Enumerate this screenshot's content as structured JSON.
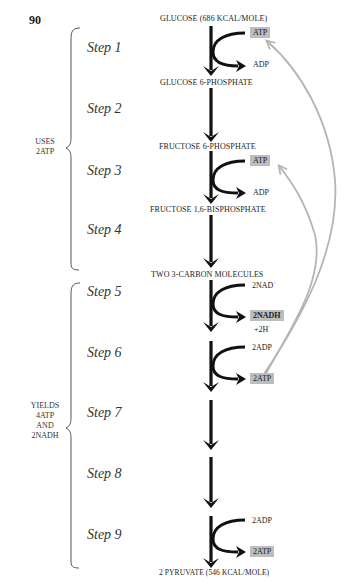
{
  "page_number": "90",
  "molecules": {
    "m0": "GLUCOSE (686 kcal/mole)",
    "m1": "GLUCOSE 6-PHOSPHATE",
    "m2": "FRUCTOSE 6-PHOSPHATE",
    "m3": "FRUCTOSE 1,6-BISPHOSPHATE",
    "m4": "TWO 3-CARBON MOLECULES",
    "m5": "2 PYRUVATE (546 kcal/mole)"
  },
  "steps": [
    "Step 1",
    "Step 2",
    "Step 3",
    "Step 4",
    "Step 5",
    "Step 6",
    "Step 7",
    "Step 8",
    "Step 9"
  ],
  "phases": {
    "uses": {
      "line1": "USES",
      "line2": "2ATP"
    },
    "yields": {
      "line1": "YIELDS",
      "line2": "4ATP",
      "line3": "AND",
      "line4": "2NADH"
    }
  },
  "side_reactions": {
    "s1_in": "ATP",
    "s1_out": "ADP",
    "s3_in": "ATP",
    "s3_out": "ADP",
    "s5_in": "2NAD",
    "s5_in_sup": "+",
    "s5_out": "2NADH",
    "s5_extra": "+2H",
    "s5_extra_sup": "+",
    "s6_in": "2ADP",
    "s6_out": "2ATP",
    "s9_in": "2ADP",
    "s9_out": "2ATP"
  },
  "colors": {
    "arrow": "#111111",
    "highlight_box": "#bdbdbd",
    "feedback_arrow": "#b5b5b5"
  }
}
